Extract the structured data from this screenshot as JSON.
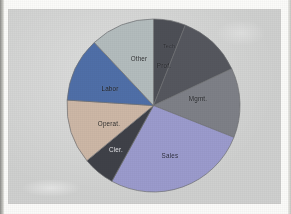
{
  "document": {
    "kind": "scanned-figure",
    "page_background": "#fbfbf9",
    "panel_background": "#cfd0cf"
  },
  "chart_data": {
    "type": "pie",
    "title": "",
    "subtitle": "",
    "xlabel": "",
    "ylabel": "",
    "legend_position": "none",
    "labels_on_slices": true,
    "start_angle_deg": 0,
    "direction": "clockwise",
    "categories": [
      "Tech",
      "Prof.",
      "Mgmt.",
      "Sales",
      "Cler.",
      "Operat.",
      "Labor",
      "Other"
    ],
    "values": [
      6,
      12,
      13,
      27,
      6,
      12,
      12,
      12
    ],
    "units": "percent",
    "slices": [
      {
        "label": "Tech",
        "value": 6,
        "color": "#4d4f56",
        "label_color": "#1b1c20",
        "label_x": 103,
        "label_y": 28,
        "tiny": true
      },
      {
        "label": "Prof.",
        "value": 12,
        "color": "#55575e",
        "label_color": "#1b1c20",
        "label_x": 98,
        "label_y": 47,
        "tiny": false
      },
      {
        "label": "Mgmt.",
        "value": 13,
        "color": "#7e8087",
        "label_color": "#1b1c20",
        "label_x": 132,
        "label_y": 80,
        "tiny": false
      },
      {
        "label": "Sales",
        "value": 27,
        "color": "#9b9bcd",
        "label_color": "#24253a",
        "label_x": 104,
        "label_y": 137,
        "tiny": false
      },
      {
        "label": "Cler.",
        "value": 6,
        "color": "#3f4148",
        "label_color": "#d8d8dc",
        "label_x": 50,
        "label_y": 131,
        "tiny": false
      },
      {
        "label": "Operat.",
        "value": 12,
        "color": "#cdb7a6",
        "label_color": "#2a2723",
        "label_x": 43,
        "label_y": 105,
        "tiny": false
      },
      {
        "label": "Labor",
        "value": 12,
        "color": "#4f6fa8",
        "label_color": "#14161c",
        "label_x": 44,
        "label_y": 70,
        "tiny": false
      },
      {
        "label": "Other",
        "value": 12,
        "color": "#b3bcbd",
        "label_color": "#2a2c2e",
        "label_x": 73,
        "label_y": 40,
        "tiny": false
      }
    ]
  }
}
